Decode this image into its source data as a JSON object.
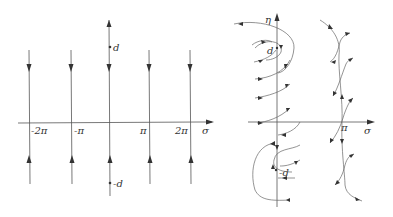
{
  "left_diagram": {
    "horizontal_axis_label": "σ",
    "tick_labels": [
      "-2π",
      "-π",
      "π",
      "2π"
    ],
    "point_labels": {
      "top": "d",
      "bottom": "-d"
    },
    "vertical_lines": 5
  },
  "right_diagram": {
    "horizontal_axis_label": "σ",
    "vertical_axis_label": "η",
    "tick_labels": [
      "π"
    ],
    "point_labels": {
      "top": "d",
      "bottom": "-d"
    }
  }
}
